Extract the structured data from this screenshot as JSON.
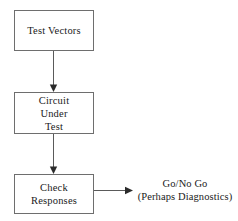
{
  "diagram": {
    "type": "flowchart",
    "background_color": "#ffffff",
    "box_border_color": "#6e6e6e",
    "arrow_color": "#5a5a5a",
    "text_color": "#1a1a1a",
    "boxes": [
      {
        "id": "test-vectors",
        "lines": [
          "Test Vectors"
        ],
        "line1": "Test Vectors"
      },
      {
        "id": "circuit-under-test",
        "lines": [
          "Circuit",
          "Under",
          "Test"
        ],
        "line1": "Circuit",
        "line2": "Under",
        "line3": "Test"
      },
      {
        "id": "check-responses",
        "lines": [
          "Check",
          "Responses"
        ],
        "line1": "Check",
        "line2": "Responses"
      }
    ],
    "output": {
      "line1": "Go/No Go",
      "line2": "(Perhaps Diagnostics)"
    },
    "connectors": [
      {
        "id": "vectors-to-circuit",
        "from": "test-vectors",
        "to": "circuit-under-test",
        "direction": "down"
      },
      {
        "id": "circuit-to-check",
        "from": "circuit-under-test",
        "to": "check-responses",
        "direction": "down"
      },
      {
        "id": "check-to-output",
        "from": "check-responses",
        "to": "output",
        "direction": "right"
      }
    ]
  }
}
